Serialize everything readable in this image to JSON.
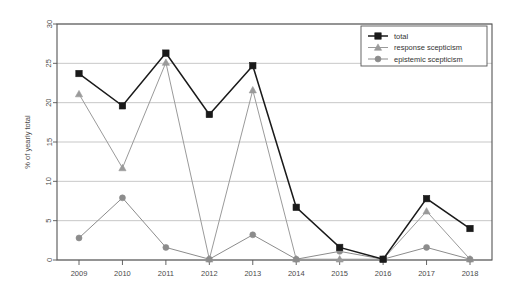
{
  "chart_data": {
    "type": "line",
    "title": "",
    "xlabel": "",
    "ylabel": "% of yearly total",
    "categories": [
      "2009",
      "2010",
      "2011",
      "2012",
      "2013",
      "2014",
      "2015",
      "2016",
      "2017",
      "2018"
    ],
    "x": [
      2009,
      2010,
      2011,
      2012,
      2013,
      2014,
      2015,
      2016,
      2017,
      2018
    ],
    "ylim": [
      0,
      30
    ],
    "xlim": [
      2008.5,
      2018.5
    ],
    "yticks": [
      0,
      5,
      10,
      15,
      20,
      25,
      30
    ],
    "grid": true,
    "legend_position": "top-right",
    "series": [
      {
        "name": "total",
        "marker": "square",
        "color": "#1a1a1a",
        "values": [
          23.7,
          19.6,
          26.3,
          18.5,
          24.7,
          6.7,
          1.6,
          0.1,
          7.8,
          4.0
        ]
      },
      {
        "name": "response scepticism",
        "marker": "triangle",
        "color": "#9a9a9a",
        "values": [
          21.1,
          11.7,
          25.1,
          0.1,
          21.6,
          0.1,
          0.1,
          0.1,
          6.2,
          0.1
        ]
      },
      {
        "name": "epistemic scepticism",
        "marker": "circle",
        "color": "#8c8c8c",
        "values": [
          2.8,
          7.9,
          1.6,
          0.1,
          3.2,
          0.1,
          1.1,
          0.1,
          1.6,
          0.1
        ]
      }
    ]
  },
  "axes": {
    "y_axis_title": "% of yearly total",
    "y_tick_labels": [
      "0",
      "5",
      "10",
      "15",
      "20",
      "25",
      "30"
    ],
    "x_tick_labels": [
      "2009",
      "2010",
      "2011",
      "2012",
      "2013",
      "2014",
      "2015",
      "2016",
      "2017",
      "2018"
    ]
  },
  "legend": {
    "entries": [
      {
        "label": "total",
        "marker": "square-marker-icon",
        "color": "#1a1a1a"
      },
      {
        "label": "response scepticism",
        "marker": "triangle-marker-icon",
        "color": "#9a9a9a"
      },
      {
        "label": "epistemic scepticism",
        "marker": "circle-marker-icon",
        "color": "#8c8c8c"
      }
    ]
  },
  "colors": {
    "total": "#1a1a1a",
    "response_scepticism": "#9a9a9a",
    "epistemic_scepticism": "#8c8c8c",
    "grid": "#b9b9b9",
    "frame": "#555555",
    "background": "#ffffff"
  }
}
